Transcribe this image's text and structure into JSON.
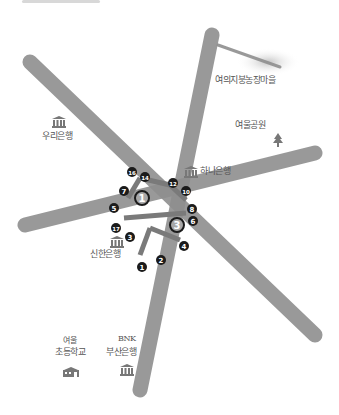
{
  "map": {
    "road_color": "#8f8f8f",
    "road_highlight_color": "#7a7a7a",
    "marker_fill": "#1b1b1b",
    "marker_text": "#ffffff",
    "exit_ring_color": "#1b1b1b",
    "exit_fill": "#a8a8a8",
    "roads": [
      {
        "id": "road-nw-se",
        "x1": 30,
        "y1": 62,
        "x2": 315,
        "y2": 335
      },
      {
        "id": "road-n-s",
        "x1": 212,
        "y1": 35,
        "x2": 140,
        "y2": 390
      },
      {
        "id": "road-w-e",
        "x1": 25,
        "y1": 225,
        "x2": 315,
        "y2": 153
      },
      {
        "id": "road-ne-spur",
        "x1": 218,
        "y1": 45,
        "x2": 280,
        "y2": 67
      }
    ],
    "exits": [
      {
        "number": "1",
        "x": 142,
        "y": 198
      },
      {
        "number": "3",
        "x": 177,
        "y": 225
      }
    ],
    "markers": [
      {
        "number": "16",
        "x": 132,
        "y": 172
      },
      {
        "number": "14",
        "x": 145,
        "y": 177
      },
      {
        "number": "12",
        "x": 173,
        "y": 183
      },
      {
        "number": "10",
        "x": 186,
        "y": 191
      },
      {
        "number": "7",
        "x": 124,
        "y": 191
      },
      {
        "number": "5",
        "x": 114,
        "y": 208
      },
      {
        "number": "8",
        "x": 192,
        "y": 209
      },
      {
        "number": "6",
        "x": 193,
        "y": 221
      },
      {
        "number": "17",
        "x": 116,
        "y": 228
      },
      {
        "number": "3",
        "x": 130,
        "y": 237
      },
      {
        "number": "4",
        "x": 184,
        "y": 246
      },
      {
        "number": "2",
        "x": 161,
        "y": 260
      },
      {
        "number": "1",
        "x": 142,
        "y": 267
      }
    ],
    "places": [
      {
        "id": "place-top-right",
        "label": "여의지붕농장마을",
        "icon": "none",
        "x": 215,
        "y": 73
      },
      {
        "id": "place-woori-bank",
        "label": "우리은행",
        "icon": "bank-icon",
        "x": 42,
        "y": 113
      },
      {
        "id": "place-park",
        "label": "여울공원",
        "icon": "tree-icon",
        "x": 245,
        "y": 120
      },
      {
        "id": "place-hana-bank",
        "label": "하나은행",
        "icon": "bank-icon",
        "x": 184,
        "y": 163
      },
      {
        "id": "place-shinhan-bank",
        "label": "신한은행",
        "icon": "bank-icon",
        "x": 90,
        "y": 233
      },
      {
        "id": "place-school",
        "label": "여울초등학교",
        "icon": "school-icon",
        "x": 55,
        "y": 348
      },
      {
        "id": "place-bnk-bank",
        "label": "부산은행",
        "sublabel": "BNK",
        "icon": "bank-icon",
        "x": 106,
        "y": 348
      }
    ]
  }
}
